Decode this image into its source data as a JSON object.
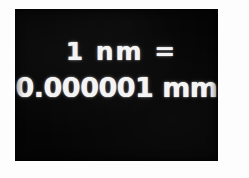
{
  "image": {
    "subject": "handwritten unit conversion on a blackboard",
    "panel_color": "#050505",
    "text_color": "#f4f4f4",
    "background_color": "#fdfdfd"
  },
  "equation": {
    "line_top": "1 nm =",
    "line_bottom": "0.000001 mm",
    "quantity": "1",
    "from_unit": "nm",
    "operator": "=",
    "value": "0.000001",
    "to_unit": "mm"
  }
}
